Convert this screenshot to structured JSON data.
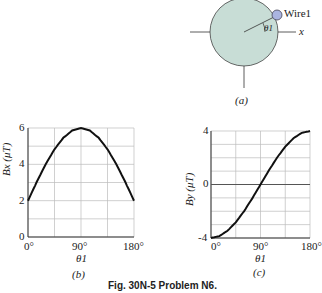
{
  "figure_a": {
    "label": "(a)",
    "wire_label": "Wire1",
    "angle_label": "θ1",
    "axis_label": "x",
    "colors": {
      "disk": "#c8ddd6",
      "wire": "#aab4e0"
    }
  },
  "caption": "Fig. 30N-5 Problem N6.",
  "chart_data": [
    {
      "panel": "(b)",
      "type": "line",
      "title": "",
      "xlabel": "θ1",
      "ylabel": "Bx (μT)",
      "xticks": [
        "0°",
        "90°",
        "180°"
      ],
      "yticks": [
        "0",
        "2",
        "4",
        "6"
      ],
      "xlim": [
        0,
        180
      ],
      "ylim": [
        0,
        6
      ],
      "grid": true,
      "x": [
        0,
        15,
        30,
        45,
        60,
        75,
        90,
        105,
        120,
        135,
        150,
        165,
        180
      ],
      "series": [
        {
          "name": "Bx",
          "values": [
            2.0,
            3.04,
            4.0,
            4.83,
            5.46,
            5.86,
            6.0,
            5.86,
            5.46,
            4.83,
            4.0,
            3.04,
            2.0
          ]
        }
      ]
    },
    {
      "panel": "(c)",
      "type": "line",
      "title": "",
      "xlabel": "θ1",
      "ylabel": "By (μT)",
      "xticks": [
        "0°",
        "90°",
        "180°"
      ],
      "yticks": [
        "-4",
        "0",
        "4"
      ],
      "xlim": [
        0,
        180
      ],
      "ylim": [
        -4,
        4
      ],
      "grid": true,
      "x": [
        0,
        15,
        30,
        45,
        60,
        75,
        90,
        105,
        120,
        135,
        150,
        165,
        180
      ],
      "series": [
        {
          "name": "By",
          "values": [
            -4.0,
            -3.86,
            -3.46,
            -2.83,
            -2.0,
            -1.04,
            0.0,
            1.04,
            2.0,
            2.83,
            3.46,
            3.86,
            4.0
          ]
        }
      ]
    }
  ]
}
